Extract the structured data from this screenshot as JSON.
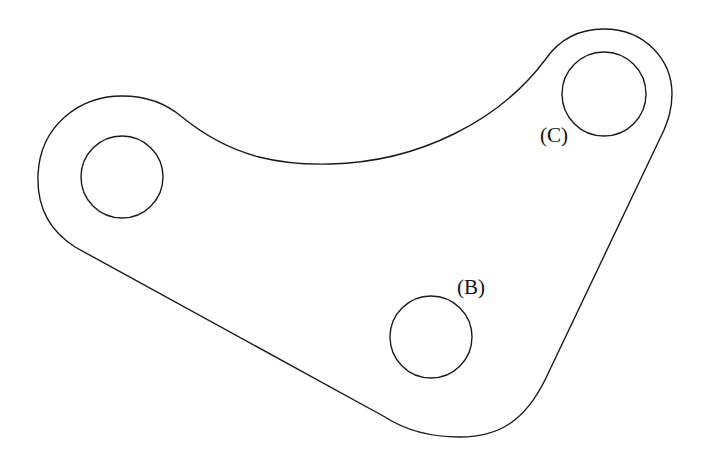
{
  "diagram": {
    "type": "mechanical-part-outline",
    "stroke_color": "#1a1a1a",
    "background": "#ffffff",
    "holes": [
      {
        "id": "A",
        "label": "",
        "cx": 122,
        "cy": 177,
        "r": 41
      },
      {
        "id": "B",
        "label": "(B)",
        "cx": 431,
        "cy": 337,
        "r": 41
      },
      {
        "id": "C",
        "label": "(C)",
        "cx": 604,
        "cy": 94,
        "r": 42
      }
    ],
    "labels": {
      "B": "(B)",
      "C": "(C)"
    }
  }
}
